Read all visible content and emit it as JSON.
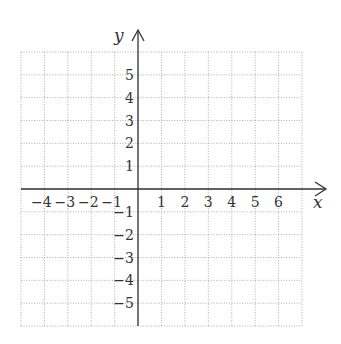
{
  "chart_data": {
    "type": "coordinate-grid",
    "title": "",
    "xlabel": "x",
    "ylabel": "y",
    "xlim": [
      -5,
      7
    ],
    "ylim": [
      -6,
      6
    ],
    "grid": true,
    "grid_style": "dotted",
    "x_ticks": [
      "-4",
      "-3",
      "-2",
      "-1",
      "1",
      "2",
      "3",
      "4",
      "5",
      "6"
    ],
    "y_ticks_positive": [
      "5",
      "4",
      "3",
      "2",
      "1"
    ],
    "y_ticks_negative": [
      "-1",
      "-2",
      "-3",
      "-4",
      "-5"
    ],
    "series": []
  },
  "labels": {
    "x_axis": "x",
    "y_axis": "y"
  }
}
